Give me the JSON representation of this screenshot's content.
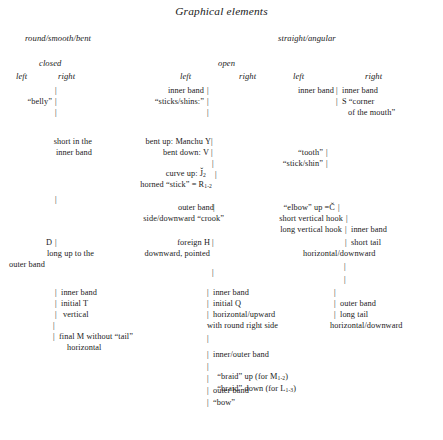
{
  "title": "Graphical elements",
  "category_headers": {
    "left": "round/smooth/bent",
    "right": "straight/angular"
  },
  "aperture_headers": {
    "closed": "closed",
    "open": "open"
  },
  "side_headers": {
    "col1": "left",
    "col2": "right",
    "col3": "left",
    "col4": "right",
    "col5": "left",
    "col6": "right"
  },
  "entries": {
    "belly": "“belly”",
    "short_in_the": "short in the",
    "inner_band_1": "inner band",
    "d_letter": "D",
    "long_up_to_the": "long up to the",
    "outer_band_left": "outer band",
    "inner_band_left_2": "inner band",
    "initial_t": "initial T",
    "vertical": "vertical",
    "final_m": "final M without “tail”",
    "horizontal_left": "horizontal",
    "inner_band_c2_1": "inner band",
    "sticks_shins": "“sticks/shins:”",
    "bent_up_manchu_y": "bent up: Manchu Y",
    "bent_down_v": "bent down: V",
    "curve_up_j2": "curve up: J̌",
    "curve_up_j2_sub": "2",
    "horned_stick_r": "horned “stick” = R",
    "horned_stick_r_sub": "1-2",
    "outer_band_c2": "outer band",
    "side_downward_crook": "side/downward “crook”",
    "foreign_h": "foreign H",
    "downward_pointed": "downward, pointed",
    "inner_band_c2_2": "inner band",
    "initial_q": "initial Q",
    "horizontal_upward": "horizontal/upward",
    "with_round_right_side": "with round right side",
    "inner_outer_band": "inner/outer band",
    "braid_up": "“braid” up (for M",
    "braid_up_sub": "1-2",
    "braid_up_end": ")",
    "braid_down": "“braid” down (for L",
    "braid_down_sub": "1-3",
    "braid_down_end": ")",
    "outer_band_c3": "outer band",
    "bow": "“bow”",
    "inner_band_c5": "inner band",
    "inner_band_c6": "inner band",
    "s_corner": "S “corner",
    "of_the_mouth": "of the mouth”",
    "tooth": "“tooth”",
    "stick_shin": "“stick/shin”",
    "elbow_up": "“elbow” up =Č",
    "short_vertical_hook": "short vertical hook",
    "long_vertical_hook": "long vertical hook",
    "inner_band_c6_2": "inner band",
    "short_tail": "short tail",
    "horizontal_downward_1": "horizontal/downward",
    "outer_band_c6": "outer band",
    "long_tail": "long tail",
    "horizontal_downward_2": "horizontal/downward"
  },
  "connector": "|",
  "colors": {
    "text": "#1a1a1a",
    "background": "#ffffff"
  }
}
